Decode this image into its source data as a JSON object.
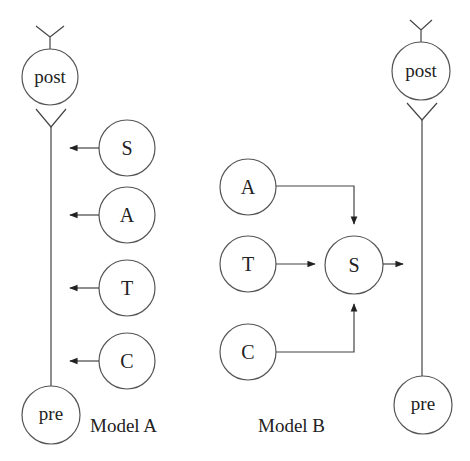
{
  "diagram": {
    "model_a": {
      "caption": "Model A",
      "post": {
        "label": "post",
        "cx": 50,
        "cy": 77,
        "r": 28
      },
      "pre": {
        "label": "pre",
        "cx": 51,
        "cy": 415,
        "r": 29
      },
      "inputs": [
        {
          "label": "S",
          "cx": 127,
          "cy": 148,
          "r": 28
        },
        {
          "label": "A",
          "cx": 127,
          "cy": 215,
          "r": 28
        },
        {
          "label": "T",
          "cx": 127,
          "cy": 288,
          "r": 28
        },
        {
          "label": "C",
          "cx": 127,
          "cy": 361,
          "r": 28
        }
      ]
    },
    "model_b": {
      "caption": "Model B",
      "hub": {
        "label": "S",
        "cx": 354,
        "cy": 265,
        "r": 29
      },
      "inputs": [
        {
          "label": "A",
          "cx": 248,
          "cy": 187,
          "r": 28
        },
        {
          "label": "T",
          "cx": 248,
          "cy": 264,
          "r": 28
        },
        {
          "label": "C",
          "cx": 248,
          "cy": 352,
          "r": 28
        }
      ]
    },
    "right_neuron": {
      "post": {
        "label": "post",
        "cx": 421,
        "cy": 71,
        "r": 29
      },
      "pre": {
        "label": "pre",
        "cx": 423,
        "cy": 405,
        "r": 29
      }
    }
  }
}
